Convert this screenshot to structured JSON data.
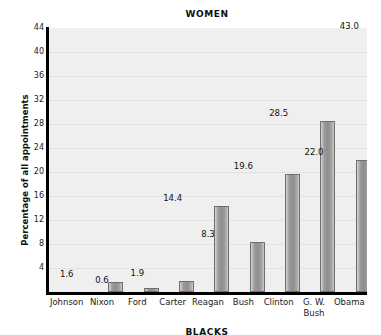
{
  "chart_data": {
    "type": "bar",
    "title": "WOMEN",
    "xlabel": "",
    "ylabel": "Percentage of all appointments",
    "categories": [
      "Johnson",
      "Nixon",
      "Ford",
      "Carter",
      "Reagan",
      "Bush",
      "Clinton",
      "G. W.\nBush",
      "Obama"
    ],
    "values": [
      1.6,
      0.6,
      1.9,
      14.4,
      8.3,
      19.6,
      28.5,
      22.0,
      43.0
    ],
    "value_labels": [
      "1.6",
      "0.6",
      "1.9",
      "14.4",
      "8.3",
      "19.6",
      "28.5",
      "22.0",
      "43.0"
    ],
    "ylim": [
      0,
      44
    ],
    "yticks": [
      4,
      8,
      12,
      16,
      20,
      24,
      28,
      32,
      36,
      40,
      44
    ],
    "ytick_labels": [
      "4",
      "8",
      "12",
      "16",
      "20",
      "24",
      "28",
      "32",
      "36",
      "40",
      "44"
    ],
    "grid": true,
    "legend": false,
    "bar_color": "#9b9b9b",
    "plot_background": "#efefef",
    "axis_color": "#000000"
  },
  "bottom_caption": "BLACKS"
}
